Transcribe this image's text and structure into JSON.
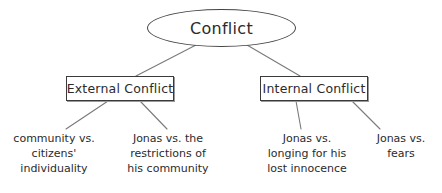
{
  "diagram": {
    "title": "Conflict",
    "type": "hierarchy-tree",
    "background_color": "#ffffff",
    "line_color": "#7a7a7a",
    "text_color": "#2b2b2b",
    "border_color": "#3a3a3a"
  },
  "nodes": {
    "root": {
      "label": "Conflict",
      "shape": "ellipse"
    },
    "external": {
      "label": "External Conflict",
      "shape": "rectangle"
    },
    "internal": {
      "label": "Internal Conflict",
      "shape": "rectangle"
    },
    "leaves": [
      {
        "id": "community-vs-citizens",
        "shape": "text",
        "parent": "external",
        "lines": [
          "community vs.",
          "citizens'",
          "individuality"
        ]
      },
      {
        "id": "jonas-vs-restrictions",
        "shape": "text",
        "parent": "external",
        "lines": [
          "Jonas vs. the",
          "restrictions of",
          "his community"
        ]
      },
      {
        "id": "jonas-vs-longing",
        "shape": "text",
        "parent": "internal",
        "lines": [
          "Jonas vs.",
          "longing for his",
          "lost innocence"
        ]
      },
      {
        "id": "jonas-vs-fears",
        "shape": "text",
        "parent": "internal",
        "lines": [
          "Jonas vs.",
          "fears"
        ]
      }
    ]
  },
  "edges": [
    {
      "id": "root-to-external",
      "from": "root",
      "to": "external"
    },
    {
      "id": "root-to-internal",
      "from": "root",
      "to": "internal"
    },
    {
      "id": "external-to-leaf1",
      "from": "external",
      "to": "community-vs-citizens"
    },
    {
      "id": "external-to-leaf2",
      "from": "external",
      "to": "jonas-vs-restrictions"
    },
    {
      "id": "internal-to-leaf3",
      "from": "internal",
      "to": "jonas-vs-longing"
    },
    {
      "id": "internal-to-leaf4",
      "from": "internal",
      "to": "jonas-vs-fears"
    }
  ]
}
